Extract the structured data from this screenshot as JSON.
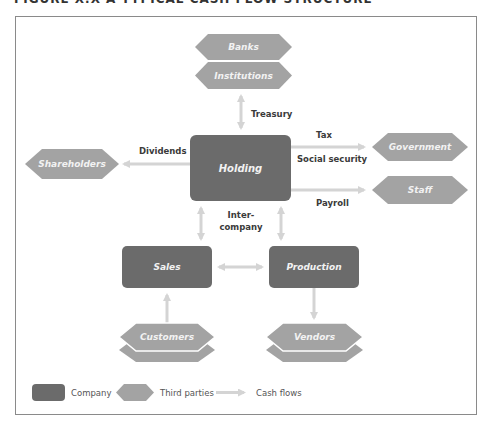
{
  "figure": {
    "title": "FIGURE X.X  A TYPICAL CASH FLOW STRUCTURE"
  },
  "colors": {
    "company": "#6b6b6b",
    "third_party": "#a3a3a3",
    "cash_flow": "#d4d4d4",
    "frame": "#8a8a8a"
  },
  "nodes": {
    "companies": {
      "holding": "Holding",
      "sales": "Sales",
      "production": "Production"
    },
    "third_parties": {
      "banks": "Banks",
      "institutions": "Institutions",
      "shareholders": "Shareholders",
      "government": "Government",
      "staff": "Staff",
      "customers": "Customers",
      "vendors": "Vendors"
    }
  },
  "flows": {
    "treasury": "Treasury",
    "dividends": "Dividends",
    "tax": "Tax",
    "social_security": "Social security",
    "payroll": "Payroll",
    "intercompany_1": "Inter-",
    "intercompany_2": "company"
  },
  "legend": {
    "company": "Company",
    "third_parties": "Third parties",
    "cash_flows": "Cash flows"
  }
}
